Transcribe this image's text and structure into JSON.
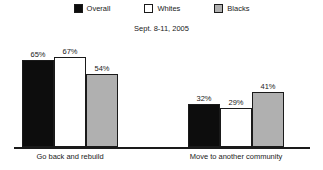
{
  "chart_data": {
    "type": "bar",
    "title": "",
    "subtitle": "Sept. 8-11, 2005",
    "xlabel": "",
    "ylabel": "",
    "ylim": [
      0,
      100
    ],
    "grid": false,
    "legend_position": "top-center",
    "value_suffix": "%",
    "categories": [
      "Go back and rebuild",
      "Move to another community"
    ],
    "series": [
      {
        "name": "Overall",
        "color": "#0d0d0d",
        "values": [
          65,
          32
        ],
        "labels": [
          "65%",
          "32%"
        ]
      },
      {
        "name": "Whites",
        "color": "#ffffff",
        "values": [
          67,
          29
        ],
        "labels": [
          "67%",
          "29%"
        ]
      },
      {
        "name": "Blacks",
        "color": "#b0b0b0",
        "values": [
          54,
          41
        ],
        "labels": [
          "54%",
          "41%"
        ]
      }
    ]
  },
  "legend": {
    "items": [
      {
        "label": "Overall",
        "swatch": "black-square-icon"
      },
      {
        "label": "Whites",
        "swatch": "white-square-icon"
      },
      {
        "label": "Blacks",
        "swatch": "gray-square-icon"
      }
    ]
  },
  "subtitle": "Sept. 8-11, 2005",
  "categories": [
    {
      "label": "Go back and rebuild"
    },
    {
      "label": "Move to another community"
    }
  ],
  "bars": [
    {
      "group": 0,
      "series": 0,
      "label": "65%"
    },
    {
      "group": 0,
      "series": 1,
      "label": "67%"
    },
    {
      "group": 0,
      "series": 2,
      "label": "54%"
    },
    {
      "group": 1,
      "series": 0,
      "label": "32%"
    },
    {
      "group": 1,
      "series": 1,
      "label": "29%"
    },
    {
      "group": 1,
      "series": 2,
      "label": "41%"
    }
  ]
}
